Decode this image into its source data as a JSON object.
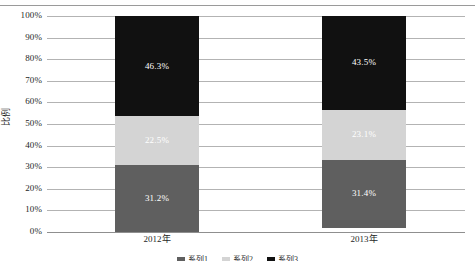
{
  "chart_data": {
    "type": "bar",
    "subtype": "100% stacked column",
    "title": "",
    "xlabel": "",
    "ylabel": "比例",
    "categories": [
      "2012年",
      "2013年"
    ],
    "ylim": [
      0,
      100
    ],
    "grid": true,
    "legend_position": "bottom",
    "ytick_labels": [
      "100%",
      "90%",
      "80%",
      "70%",
      "60%",
      "50%",
      "40%",
      "30%",
      "20%",
      "10%",
      "0%"
    ],
    "ytick_values": [
      100,
      90,
      80,
      70,
      60,
      50,
      40,
      30,
      20,
      10,
      0
    ],
    "series": [
      {
        "name": "系列1",
        "color": "#5f5f5f",
        "values": [
          31.2,
          31.4
        ],
        "labels": [
          "31.2%",
          "31.4%"
        ]
      },
      {
        "name": "系列2",
        "color": "#d4d4d4",
        "values": [
          22.5,
          23.1
        ],
        "labels": [
          "22.5%",
          "23.1%"
        ]
      },
      {
        "name": "系列3",
        "color": "#111111",
        "values": [
          46.3,
          43.5
        ],
        "labels": [
          "46.3%",
          "43.5%"
        ]
      }
    ],
    "colors": {
      "series_bottom": "#5f5f5f",
      "series_middle": "#d4d4d4",
      "series_top": "#111111",
      "gridline": "#b3b3b3",
      "axis": "#8f8f8f",
      "data_label": "#ffffff"
    }
  },
  "axis": {
    "y": {
      "title": "比例",
      "ticks": [
        {
          "label": "100%"
        },
        {
          "label": "90%"
        },
        {
          "label": "80%"
        },
        {
          "label": "70%"
        },
        {
          "label": "60%"
        },
        {
          "label": "50%"
        },
        {
          "label": "40%"
        },
        {
          "label": "30%"
        },
        {
          "label": "20%"
        },
        {
          "label": "10%"
        },
        {
          "label": "0%"
        }
      ]
    },
    "x": {
      "categories": [
        {
          "label": "2012年"
        },
        {
          "label": "2013年"
        }
      ]
    }
  },
  "bars": [
    {
      "category": "2012年",
      "segments": [
        {
          "series": "系列3",
          "label": "46.3%",
          "value": 46.3,
          "color": "#111111"
        },
        {
          "series": "系列2",
          "label": "22.5%",
          "value": 22.5,
          "color": "#d4d4d4"
        },
        {
          "series": "系列1",
          "label": "31.2%",
          "value": 31.2,
          "color": "#5f5f5f"
        }
      ]
    },
    {
      "category": "2013年",
      "segments": [
        {
          "series": "系列3",
          "label": "43.5%",
          "value": 43.5,
          "color": "#111111"
        },
        {
          "series": "系列2",
          "label": "23.1%",
          "value": 23.1,
          "color": "#d4d4d4"
        },
        {
          "series": "系列1",
          "label": "31.4%",
          "value": 31.4,
          "color": "#5f5f5f"
        }
      ]
    }
  ],
  "legend": {
    "clipped": true,
    "items": [
      {
        "label": "系列1",
        "color": "#5f5f5f"
      },
      {
        "label": "系列2",
        "color": "#d4d4d4"
      },
      {
        "label": "系列3",
        "color": "#111111"
      }
    ]
  }
}
